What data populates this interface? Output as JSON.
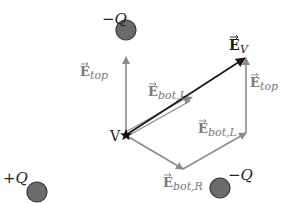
{
  "charges": [
    {
      "id": "top",
      "label": "−Q",
      "cx": 126,
      "cy": 30,
      "r": 10
    },
    {
      "id": "bottom-left",
      "label": "+Q",
      "cx": 37,
      "cy": 192,
      "r": 10
    },
    {
      "id": "bottom-right",
      "label": "−Q",
      "cx": 220,
      "cy": 188,
      "r": 10
    }
  ],
  "point": {
    "label": "V",
    "x": 126,
    "y": 135
  },
  "vectors": {
    "e_top_left": {
      "label_main": "E",
      "label_sub": "top"
    },
    "e_bot_l_first": {
      "label_main": "E",
      "label_sub": "bot,L"
    },
    "e_v": {
      "label_main": "E",
      "label_sub": "V"
    },
    "e_top_right": {
      "label_main": "E",
      "label_sub": "top"
    },
    "e_bot_l_second": {
      "label_main": "E",
      "label_sub": "bot,L"
    },
    "e_bot_r": {
      "label_main": "E",
      "label_sub": "bot,R"
    }
  },
  "colors": {
    "charge_fill": "#6b6b6b",
    "charge_stroke": "#3a3a3a",
    "gray_vector": "#8c8c8c",
    "result_vector": "#1a1a1a",
    "label_gray": "#7a7a7a",
    "label_dark": "#222222"
  }
}
